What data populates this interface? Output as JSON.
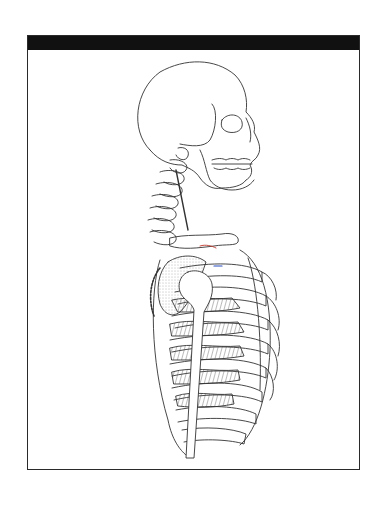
{
  "figure": {
    "header_bar_color": "#111111",
    "frame_border_color": "#2a2a2a",
    "line_color": "#333333",
    "muscle_fill_color": "#8a8a8a",
    "accent_marks": [
      "#c0392b",
      "#2b4fc0"
    ]
  }
}
